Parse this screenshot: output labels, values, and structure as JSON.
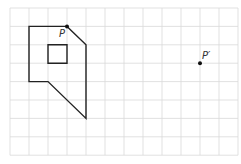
{
  "diagram": {
    "type": "grid-translation",
    "grid": {
      "columns": 12,
      "rows": 8,
      "origin_px": [
        10,
        8
      ],
      "cell_w": 19,
      "cell_h": 18.4,
      "line_color": "#d9d9d9"
    },
    "shape": {
      "stroke_color": "#222222",
      "outline_grid": [
        [
          1,
          1
        ],
        [
          3,
          1
        ],
        [
          4,
          2
        ],
        [
          4,
          6
        ],
        [
          2,
          4
        ],
        [
          1,
          4
        ]
      ],
      "hole_grid": [
        [
          2,
          2
        ],
        [
          3,
          2
        ],
        [
          3,
          3
        ],
        [
          2,
          3
        ]
      ]
    },
    "points": [
      {
        "id": "P",
        "label": "P",
        "grid": [
          3,
          1
        ]
      },
      {
        "id": "P_prime",
        "label": "P′",
        "grid": [
          10,
          3
        ]
      }
    ]
  }
}
